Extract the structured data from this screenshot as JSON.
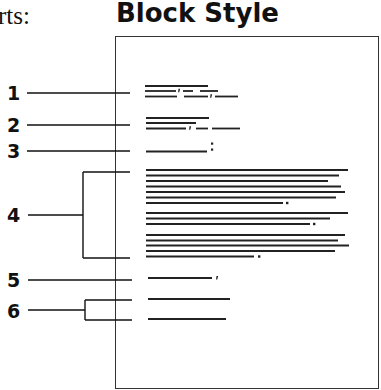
{
  "header": {
    "previous_text_fragment": "rts:",
    "title": "Block Style"
  },
  "diagram": {
    "type": "business letter block style layout",
    "callouts": [
      {
        "number": "1",
        "part": "heading"
      },
      {
        "number": "2",
        "part": "inside address"
      },
      {
        "number": "3",
        "part": "salutation"
      },
      {
        "number": "4",
        "part": "body"
      },
      {
        "number": "5",
        "part": "closing"
      },
      {
        "number": "6",
        "part": "signature"
      }
    ]
  },
  "colors": {
    "ink": "#111111",
    "page_border": "#333333",
    "background": "#ffffff"
  }
}
